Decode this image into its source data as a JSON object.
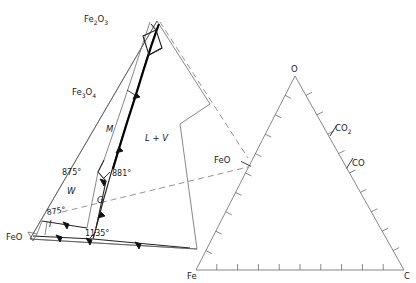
{
  "figure": {
    "background_color": "#ffffff",
    "line_color": "#222222",
    "thin_line_color": "#555555",
    "dashed_line_color": "#666666"
  },
  "left_diagram": {
    "name": "enlarged-feo-fe2o3-region",
    "corner_labels": [
      {
        "id": "fe2o3",
        "text": "Fe",
        "sub1": "2",
        "mid": "O",
        "sub2": "3",
        "x": 84,
        "y": 22
      },
      {
        "id": "fe3o4",
        "text": "Fe",
        "sub1": "3",
        "mid": "O",
        "sub2": "4",
        "x": 72,
        "y": 95
      },
      {
        "id": "feo",
        "text": "FeO",
        "x": 6,
        "y": 240
      }
    ],
    "phase_labels": [
      {
        "id": "magnetite",
        "text": "M",
        "x": 106,
        "y": 132
      },
      {
        "id": "liquid-vapor",
        "text": "L + V",
        "x": 145,
        "y": 141
      },
      {
        "id": "wustite",
        "text": "W",
        "x": 67,
        "y": 194
      },
      {
        "id": "gamma",
        "text": "G",
        "x": 97,
        "y": 203
      },
      {
        "id": "iron",
        "text": "I",
        "x": 49,
        "y": 227
      }
    ],
    "temperature_labels": [
      {
        "id": "t-875-upper",
        "text": "875°",
        "x": 62,
        "y": 175
      },
      {
        "id": "t-881",
        "text": "881°",
        "x": 112,
        "y": 176
      },
      {
        "id": "t-875-lower",
        "text": "875°",
        "x": 47,
        "y": 215
      },
      {
        "id": "t-1135",
        "text": "1135°",
        "x": 85,
        "y": 236
      }
    ]
  },
  "right_triangle": {
    "name": "fe-o-c-ternary-triangle",
    "vertex_labels": [
      {
        "id": "vertex-o",
        "text": "O",
        "x": 291,
        "y": 72
      },
      {
        "id": "vertex-fe",
        "text": "Fe",
        "x": 187,
        "y": 279
      },
      {
        "id": "vertex-c",
        "text": "C",
        "x": 404,
        "y": 279
      }
    ],
    "composition_labels": [
      {
        "id": "point-feo",
        "text": "FeO",
        "x": 214,
        "y": 163
      },
      {
        "id": "point-co2",
        "text": "CO",
        "sub": "2",
        "x": 335,
        "y": 131
      },
      {
        "id": "point-co",
        "text": "CO",
        "x": 352,
        "y": 166
      }
    ],
    "tick_count_per_edge": 10
  }
}
